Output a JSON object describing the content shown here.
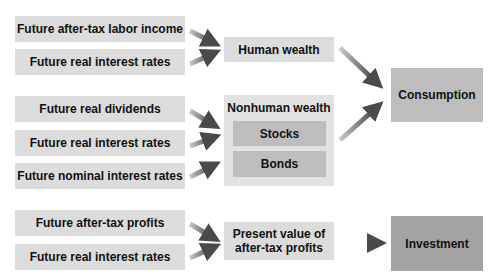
{
  "inputs": {
    "labor_income": "Future after-tax labor income",
    "real_rates_1": "Future real interest rates",
    "real_dividends": "Future real dividends",
    "real_rates_2": "Future real interest rates",
    "nominal_rates": "Future nominal interest rates",
    "aftertax_profits": "Future after-tax profits",
    "real_rates_3": "Future real interest rates"
  },
  "intermediate": {
    "human_wealth": "Human wealth",
    "nonhuman_wealth": "Nonhuman wealth",
    "stocks": "Stocks",
    "bonds": "Bonds",
    "present_value_line1": "Present value of",
    "present_value_line2": "after-tax profits"
  },
  "outputs": {
    "consumption": "Consumption",
    "investment": "Investment"
  },
  "colors": {
    "light_box": "#dcdcdc",
    "mid_box": "#bdbdbd",
    "dark_box": "#a3a3a3",
    "arrow": "#555555"
  }
}
